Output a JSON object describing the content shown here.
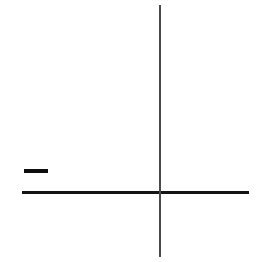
{
  "figure": {
    "title": "Axis cross with minus dash",
    "description": "A thin vertical line crossing a thicker horizontal line, with a short horizontal dash to the left above the horizontal line.",
    "background_color": "#ffffff",
    "width": 257,
    "height": 262
  },
  "elements": {
    "horizontal_axis": {
      "name": "horizontal axis",
      "color": "#141414",
      "x_start": 22,
      "x_end": 249,
      "y": 192,
      "thickness": 3
    },
    "vertical_axis": {
      "name": "vertical axis",
      "color": "#4a4a4a",
      "x": 160,
      "y_start": 5,
      "y_end": 257,
      "thickness": 2
    },
    "minus_dash": {
      "name": "minus dash",
      "color": "#0d0d0d",
      "x_start": 24,
      "x_end": 48,
      "y": 171,
      "thickness": 4
    },
    "intersection": {
      "name": "origin",
      "x": 160,
      "y": 192
    }
  },
  "chart_data": {
    "type": "line",
    "title": "",
    "xlabel": "",
    "ylabel": "",
    "grid": false,
    "legend": false,
    "axes": {
      "origin_px": [
        160,
        192
      ],
      "x_axis_px": [
        [
          22,
          192
        ],
        [
          249,
          192
        ]
      ],
      "y_axis_px": [
        [
          160,
          5
        ],
        [
          160,
          257
        ]
      ]
    },
    "series": [
      {
        "name": "dash-segment",
        "points_px": [
          [
            24,
            171
          ],
          [
            48,
            171
          ]
        ]
      }
    ]
  }
}
